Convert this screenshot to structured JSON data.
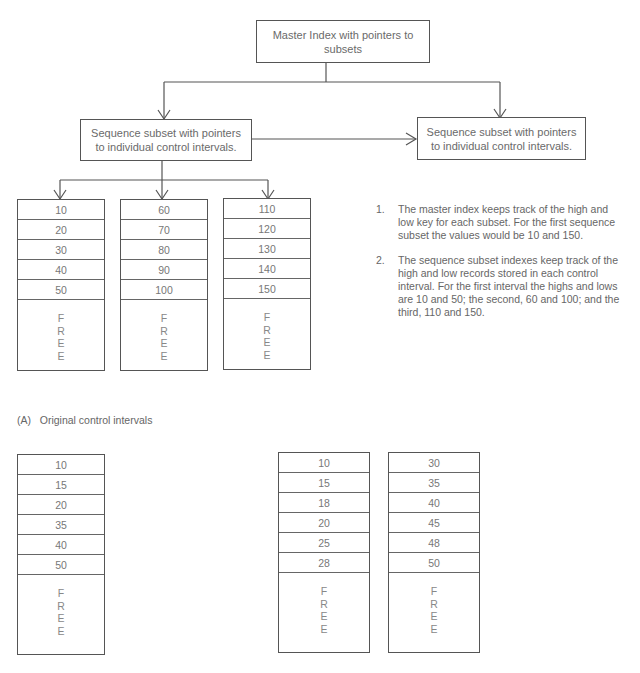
{
  "master_index": {
    "label": "Master Index with pointers to subsets"
  },
  "sequence_subsets": [
    {
      "label": "Sequence subset with pointers to individual control intervals."
    },
    {
      "label": "Sequence subset with pointers to individual control intervals."
    }
  ],
  "original_intervals": [
    {
      "records": [
        "10",
        "20",
        "30",
        "40",
        "50"
      ],
      "free": [
        "F",
        "R",
        "E",
        "E"
      ]
    },
    {
      "records": [
        "60",
        "70",
        "80",
        "90",
        "100"
      ],
      "free": [
        "F",
        "R",
        "E",
        "E"
      ]
    },
    {
      "records": [
        "110",
        "120",
        "130",
        "140",
        "150"
      ],
      "free": [
        "F",
        "R",
        "E",
        "E"
      ]
    }
  ],
  "notes": [
    {
      "number": "1.",
      "text": "The master index keeps track of the high and low key for each subset. For the first sequence subset the values would be 10 and 150."
    },
    {
      "number": "2.",
      "text": "The sequence subset indexes keep track of the high and low records stored in each control interval. For the first interval the highs and lows are 10 and 50; the second, 60 and 100; and the third, 110 and 150."
    }
  ],
  "caption_a": "(A)   Original control intervals",
  "lower_left_interval": {
    "records": [
      "10",
      "15",
      "20",
      "35",
      "40",
      "50"
    ],
    "free": [
      "F",
      "R",
      "E",
      "E"
    ]
  },
  "split_intervals": [
    {
      "records": [
        "10",
        "15",
        "18",
        "20",
        "25",
        "28"
      ],
      "free": [
        "F",
        "R",
        "E",
        "E"
      ]
    },
    {
      "records": [
        "30",
        "35",
        "40",
        "45",
        "48",
        "50"
      ],
      "free": [
        "F",
        "R",
        "E",
        "E"
      ]
    }
  ]
}
